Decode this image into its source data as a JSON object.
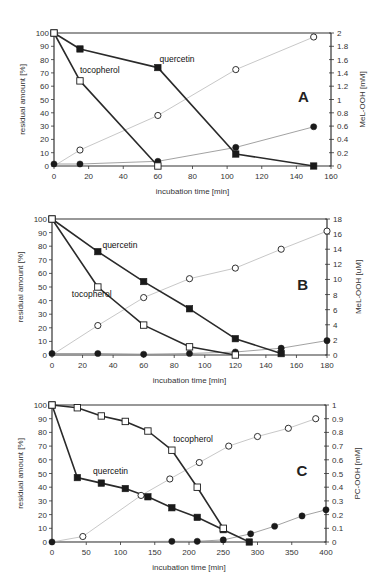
{
  "chart_data": [
    {
      "type": "line",
      "panel": "A",
      "xlabel": "incubation time [min]",
      "ylabel": "residual amount [%]",
      "y2label": "MeL-OOH [mM]",
      "xlim": [
        0,
        160
      ],
      "ylim": [
        0,
        100
      ],
      "y2lim": [
        0,
        2
      ],
      "xticks": [
        0,
        20,
        40,
        60,
        80,
        100,
        120,
        140,
        160
      ],
      "yticks": [
        0,
        10,
        20,
        30,
        40,
        50,
        60,
        70,
        80,
        90,
        100
      ],
      "y2ticks": [
        "0",
        "0.2",
        "0.4",
        "0.6",
        "0.8",
        "1",
        "1.2",
        "1.4",
        "1.6",
        "1.8",
        "2"
      ],
      "grid": false,
      "annotations": [
        {
          "text": "quercetin",
          "x": 61,
          "y": 78
        },
        {
          "text": "tocopherol",
          "x": 15,
          "y": 70
        },
        {
          "text": "A",
          "x": 144,
          "y": 48,
          "letter": true
        }
      ],
      "series": [
        {
          "name": "quercetin",
          "axis": "left",
          "marker": "filled-square",
          "line": "dark",
          "x": [
            0,
            15,
            60,
            105,
            150
          ],
          "y": [
            100,
            88,
            74,
            9,
            0
          ]
        },
        {
          "name": "tocopherol",
          "axis": "left",
          "marker": "open-square",
          "line": "dark",
          "x": [
            0,
            15,
            60
          ],
          "y": [
            100,
            64,
            0
          ]
        },
        {
          "name": "MeL-OOH (tocopherol)",
          "axis": "right",
          "marker": "open-circle",
          "line": "light",
          "x": [
            0,
            15,
            60,
            105,
            150
          ],
          "y": [
            0,
            0.24,
            0.76,
            1.45,
            1.94
          ]
        },
        {
          "name": "MeL-OOH (quercetin)",
          "axis": "right",
          "marker": "filled-circle",
          "line": "medium",
          "x": [
            0,
            15,
            60,
            105,
            150
          ],
          "y": [
            0.03,
            0.03,
            0.07,
            0.28,
            0.59
          ]
        }
      ]
    },
    {
      "type": "line",
      "panel": "B",
      "xlabel": "incubation time [min]",
      "ylabel": "residual amount [%]",
      "y2label": "MeL-OOH [uM]",
      "xlim": [
        0,
        180
      ],
      "ylim": [
        0,
        100
      ],
      "y2lim": [
        0,
        18
      ],
      "xticks": [
        0,
        20,
        40,
        60,
        80,
        100,
        120,
        140,
        160,
        180
      ],
      "yticks": [
        0,
        10,
        20,
        30,
        40,
        50,
        60,
        70,
        80,
        90,
        100
      ],
      "y2ticks": [
        "0",
        "2",
        "4",
        "6",
        "8",
        "10",
        "12",
        "14",
        "16",
        "18"
      ],
      "grid": false,
      "annotations": [
        {
          "text": "quercetin",
          "x": 33,
          "y": 79
        },
        {
          "text": "tocopherol",
          "x": 13,
          "y": 43
        },
        {
          "text": "B",
          "x": 164,
          "y": 48,
          "letter": true
        }
      ],
      "series": [
        {
          "name": "quercetin",
          "axis": "left",
          "marker": "filled-square",
          "line": "dark",
          "x": [
            0,
            30,
            60,
            90,
            120,
            150
          ],
          "y": [
            100,
            76,
            54,
            34,
            12,
            1
          ]
        },
        {
          "name": "tocopherol",
          "axis": "left",
          "marker": "open-square",
          "line": "dark",
          "x": [
            0,
            30,
            60,
            90,
            120
          ],
          "y": [
            100,
            50,
            22,
            6,
            0
          ]
        },
        {
          "name": "MeL-OOH (tocopherol)",
          "axis": "right",
          "marker": "open-circle",
          "line": "light",
          "x": [
            0,
            30,
            60,
            90,
            120,
            150,
            180
          ],
          "y": [
            0,
            3.9,
            7.6,
            10.1,
            11.5,
            14.0,
            16.4
          ]
        },
        {
          "name": "MeL-OOH (quercetin)",
          "axis": "right",
          "marker": "filled-circle",
          "line": "medium",
          "x": [
            0,
            30,
            60,
            90,
            120,
            150,
            180
          ],
          "y": [
            0.2,
            0.2,
            0.1,
            0.2,
            0.4,
            0.9,
            1.9
          ]
        }
      ]
    },
    {
      "type": "line",
      "panel": "C",
      "xlabel": "incubation time [min]",
      "ylabel": "residual amount [%]",
      "y2label": "PC-OOH [mM]",
      "xlim": [
        0,
        400
      ],
      "ylim": [
        0,
        100
      ],
      "y2lim": [
        0,
        1
      ],
      "xticks": [
        0,
        50,
        100,
        150,
        200,
        250,
        300,
        350,
        400
      ],
      "yticks": [
        0,
        10,
        20,
        30,
        40,
        50,
        60,
        70,
        80,
        90,
        100
      ],
      "y2ticks": [
        "0",
        "0.1",
        "0.2",
        "0.3",
        "0.4",
        "0.5",
        "0.6",
        "0.7",
        "0.8",
        "0.9",
        "1"
      ],
      "grid": false,
      "annotations": [
        {
          "text": "tocopherol",
          "x": 177,
          "y": 73
        },
        {
          "text": "quercetin",
          "x": 60,
          "y": 50
        },
        {
          "text": "C",
          "x": 365,
          "y": 48,
          "letter": true
        }
      ],
      "series": [
        {
          "name": "quercetin",
          "axis": "left",
          "marker": "filled-square",
          "line": "dark",
          "x": [
            0,
            37,
            72,
            107,
            140,
            175,
            212,
            250,
            288
          ],
          "y": [
            100,
            47,
            43,
            39,
            33,
            25,
            18,
            9,
            0
          ]
        },
        {
          "name": "tocopherol",
          "axis": "left",
          "marker": "open-square",
          "line": "dark",
          "x": [
            0,
            37,
            72,
            107,
            140,
            175,
            212,
            250
          ],
          "y": [
            100,
            98,
            92,
            88,
            81,
            67,
            40,
            10
          ]
        },
        {
          "name": "PC-OOH (tocopherol)",
          "axis": "right",
          "marker": "open-circle",
          "line": "light",
          "x": [
            0,
            45,
            130,
            172,
            215,
            258,
            300,
            345,
            385
          ],
          "y": [
            0,
            0.04,
            0.34,
            0.46,
            0.58,
            0.7,
            0.77,
            0.83,
            0.9
          ]
        },
        {
          "name": "PC-OOH (quercetin)",
          "axis": "right",
          "marker": "filled-circle",
          "line": "medium",
          "x": [
            0,
            175,
            212,
            250,
            290,
            325,
            365,
            400
          ],
          "y": [
            0,
            0.005,
            0.005,
            0.015,
            0.06,
            0.115,
            0.19,
            0.235
          ]
        }
      ]
    }
  ],
  "layout": {
    "panels": [
      {
        "x0": 54,
        "x1": 331,
        "yTop": 33,
        "yBot": 166
      },
      {
        "x0": 52,
        "x1": 327,
        "yTop": 219,
        "yBot": 355
      },
      {
        "x0": 52,
        "x1": 326,
        "yTop": 405,
        "yBot": 542
      }
    ]
  },
  "colors": {
    "axis": "#333333",
    "dark_line": "#2a2a2a",
    "medium_line": "#8a8a8a",
    "light_line": "#c8c8c8",
    "marker_fill": "#1a1a1a",
    "open_fill": "#ffffff"
  }
}
